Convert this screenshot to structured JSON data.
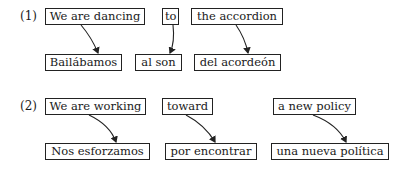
{
  "examples": [
    {
      "label": "(1)",
      "source": [
        "We are dancing",
        "to",
        "the accordion"
      ],
      "target": [
        "Bailábamos",
        "al son",
        "del acordeón"
      ]
    },
    {
      "label": "(2)",
      "source": [
        "We are working",
        "toward",
        "a new policy"
      ],
      "target": [
        "Nos esforzamos",
        "por encontrar",
        "una nueva política"
      ]
    }
  ],
  "colors": {
    "stroke": "#222222",
    "text": "#1a1a1a",
    "background": "#ffffff"
  }
}
